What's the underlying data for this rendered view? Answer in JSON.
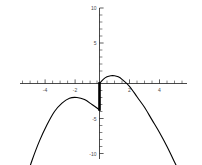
{
  "chart_data": {
    "type": "line",
    "title": "",
    "subtitle": "",
    "xlabel": "",
    "ylabel": "",
    "xlim": [
      -5.6,
      5.6
    ],
    "ylim": [
      -10,
      10
    ],
    "grid": false,
    "legend_position": "none",
    "x_ticks_major": [
      -4,
      -2,
      2,
      4
    ],
    "x_tick_labels": [
      "-4",
      "-2",
      "2",
      "4"
    ],
    "x_ticks_minor": [
      -5.5,
      -5,
      -4.5,
      -3.5,
      -3,
      -2.5,
      -1.5,
      -1,
      -0.5,
      0.5,
      1,
      1.5,
      2.5,
      3,
      3.5,
      4.5,
      5,
      5.5
    ],
    "y_ticks_major": [
      10,
      5,
      -5,
      -10
    ],
    "y_tick_labels": [
      "10",
      "5",
      "-5",
      "-10"
    ],
    "y_ticks_minor": [
      9,
      8,
      7,
      6,
      4,
      3,
      2,
      1,
      -1,
      -2,
      -3,
      -4,
      -6,
      -7,
      -8,
      -9
    ],
    "series": [
      {
        "name": "left-branch",
        "comment": "downward parabola branch left of origin",
        "x": [
          -5.5,
          -5.0,
          -4.5,
          -4.0,
          -3.5,
          -3.0,
          -2.5,
          -2.0,
          -1.5,
          -1.0,
          -0.5,
          -0.1,
          0.0
        ],
        "y": [
          -18.0,
          -14.2,
          -11.0,
          -8.2,
          -5.9,
          -4.0,
          -2.8,
          -2.1,
          -2.0,
          -2.3,
          -3.0,
          -3.6,
          -3.8
        ]
      },
      {
        "name": "right-branch",
        "comment": "downward parabola branch right of origin",
        "x": [
          0.0,
          0.25,
          0.5,
          0.75,
          1.0,
          1.25,
          1.5,
          2.0,
          2.5,
          3.0,
          3.5,
          4.0,
          4.5,
          5.0,
          5.4
        ],
        "y": [
          0.0,
          0.6,
          0.95,
          1.1,
          1.1,
          0.95,
          0.6,
          -0.4,
          -1.9,
          -3.4,
          -5.2,
          -7.0,
          -9.0,
          -11.2,
          -13.0
        ]
      }
    ],
    "annotations": [
      {
        "name": "discontinuity-segment",
        "type": "vertical-segment",
        "x": 0,
        "y_from": 0.2,
        "y_to": -3.9
      }
    ]
  }
}
